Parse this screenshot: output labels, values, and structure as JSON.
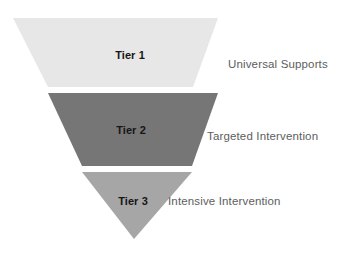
{
  "diagram": {
    "type": "inverted-funnel",
    "title": "",
    "background_color": "#ffffff",
    "tiers": [
      {
        "id": "tier-1",
        "label": "Tier 1",
        "side_label": "Universal Supports",
        "fill_color": "#e7e7e7",
        "label_color": "#161616",
        "side_label_color": "#5d5d5d",
        "shape": "trapezoid",
        "points": "13,18 218,18 193,87 48,87"
      },
      {
        "id": "tier-2",
        "label": "Tier 2",
        "side_label": "Targeted Intervention",
        "fill_color": "#767676",
        "label_color": "#161616",
        "side_label_color": "#5d5d5d",
        "shape": "trapezoid",
        "points": "48,93 218,93 192,166 82,166"
      },
      {
        "id": "tier-3",
        "label": "Tier 3",
        "side_label": "Intensive Intervention",
        "fill_color": "#a6a6a6",
        "label_color": "#161616",
        "side_label_color": "#5d5d5d",
        "shape": "triangle",
        "points": "82,172 192,172 134,239"
      }
    ]
  }
}
